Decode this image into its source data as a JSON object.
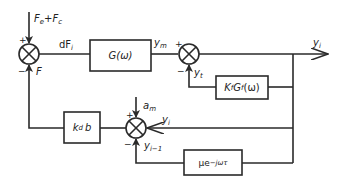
{
  "diagram": {
    "type": "block-diagram",
    "inputs": {
      "top_input": "F_e + F_c",
      "top_input_parts": {
        "a": "F",
        "a_sub": "e",
        "plus": "+",
        "b": "F",
        "b_sub": "c"
      },
      "disturbance": {
        "main": "a",
        "sub": "m"
      }
    },
    "blocks": [
      {
        "id": "G",
        "label": "G(ω)"
      },
      {
        "id": "KfGf",
        "label_parts": {
          "k": "K",
          "k_sub": "f",
          "g": "G",
          "g_sub": "f",
          "arg": "(ω)"
        }
      },
      {
        "id": "kdb",
        "label_parts": {
          "k": "k",
          "k_sub": "d",
          "b": "b"
        }
      },
      {
        "id": "delay",
        "label_parts": {
          "mu": "μe",
          "exp": "−jωτ"
        }
      }
    ],
    "summing_junctions": [
      {
        "id": "S1",
        "signs": {
          "top": "+",
          "bottom": "−"
        }
      },
      {
        "id": "S2",
        "signs": {
          "left": "+",
          "bottom": "−"
        }
      },
      {
        "id": "S3",
        "signs": {
          "top": "+",
          "bottom": "−"
        }
      }
    ],
    "signals": {
      "dFi": {
        "main": "dF",
        "sub": "i"
      },
      "F": {
        "main": "F"
      },
      "ym": {
        "main": "y",
        "sub": "m"
      },
      "yt": {
        "main": "y",
        "sub": "t"
      },
      "yi_out": {
        "main": "y",
        "sub": "i"
      },
      "yi_fb": {
        "main": "y",
        "sub": "i"
      },
      "yi_minus_1": {
        "main": "y",
        "sub": "i−1"
      }
    },
    "colors": {
      "line": "#2a2a2a",
      "background": "#ffffff"
    }
  }
}
